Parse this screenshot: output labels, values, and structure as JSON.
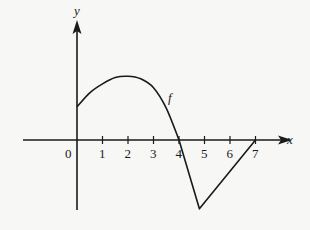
{
  "chart_data": {
    "type": "line",
    "title": "",
    "xlabel": "x",
    "ylabel": "y",
    "origin_label": "0",
    "x_ticks": [
      1,
      2,
      3,
      4,
      5,
      6,
      7
    ],
    "x_tick_labels": [
      "1",
      "2",
      "3",
      "4",
      "5",
      "6",
      "7"
    ],
    "y_ticks": [],
    "y_scale_shown": false,
    "xlim": [
      -2.1,
      8.4
    ],
    "ylim": [
      -2.8,
      4.7
    ],
    "grid": false,
    "legend": null,
    "y_value_note": "y-axis has no tick labels; y values below are visual estimates assuming the x-axis unit scale, not values read from the figure",
    "series": [
      {
        "name": "f",
        "label": "f",
        "segments": [
          {
            "kind": "curve",
            "description": "concave-down arc from y-intercept, peak near x=2, crossing zero at x=4",
            "points": [
              {
                "x": 0,
                "y": 1.3
              },
              {
                "x": 0.5,
                "y": 1.85
              },
              {
                "x": 1,
                "y": 2.2
              },
              {
                "x": 1.5,
                "y": 2.45
              },
              {
                "x": 2,
                "y": 2.5
              },
              {
                "x": 2.5,
                "y": 2.4
              },
              {
                "x": 3,
                "y": 2.05
              },
              {
                "x": 3.5,
                "y": 1.25
              },
              {
                "x": 4,
                "y": 0
              }
            ]
          },
          {
            "kind": "line",
            "description": "straight segment down to minimum",
            "points": [
              {
                "x": 4,
                "y": 0
              },
              {
                "x": 4.8,
                "y": -2.7
              }
            ]
          },
          {
            "kind": "line",
            "description": "straight segment back up to the x-axis at x=7",
            "points": [
              {
                "x": 4.8,
                "y": -2.7
              },
              {
                "x": 7,
                "y": 0
              }
            ]
          }
        ],
        "key_points": {
          "y_intercept": {
            "x": 0,
            "y": 1.3
          },
          "local_max": {
            "x": 2,
            "y": 2.5
          },
          "zeros": [
            4,
            7
          ],
          "minimum": {
            "x": 4.8,
            "y": -2.7
          }
        },
        "label_position": {
          "x": 3.65,
          "y": 1.9
        }
      }
    ]
  },
  "colors": {
    "ink": "#1a1a1a",
    "background": "#f7f7f5"
  }
}
